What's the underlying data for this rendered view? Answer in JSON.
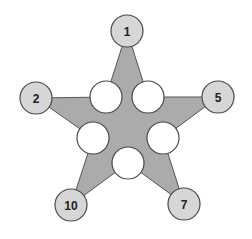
{
  "diagram": {
    "type": "star-number-puzzle",
    "colors": {
      "star_fill": "#ababab",
      "outer_node_fill": "#d6d6d6",
      "inner_node_fill": "#ffffff",
      "stroke": "#4a4a4a",
      "label": "#222222"
    },
    "outer_nodes": [
      {
        "id": "top",
        "label": "1",
        "x": 127,
        "y": 31,
        "r": 16
      },
      {
        "id": "right",
        "label": "5",
        "x": 218,
        "y": 97,
        "r": 16
      },
      {
        "id": "bottom-right",
        "label": "7",
        "x": 184,
        "y": 204,
        "r": 16
      },
      {
        "id": "bottom-left",
        "label": "10",
        "x": 71,
        "y": 205,
        "r": 16
      },
      {
        "id": "left",
        "label": "2",
        "x": 36,
        "y": 98,
        "r": 16
      }
    ],
    "inner_nodes": [
      {
        "id": "inner-top-left",
        "label": "",
        "x": 106,
        "y": 97,
        "r": 16
      },
      {
        "id": "inner-top-right",
        "label": "",
        "x": 148,
        "y": 97,
        "r": 16
      },
      {
        "id": "inner-mid-right",
        "label": "",
        "x": 163,
        "y": 138,
        "r": 16
      },
      {
        "id": "inner-bottom",
        "label": "",
        "x": 128,
        "y": 163,
        "r": 16
      },
      {
        "id": "inner-mid-left",
        "label": "",
        "x": 93,
        "y": 138,
        "r": 16
      }
    ]
  }
}
